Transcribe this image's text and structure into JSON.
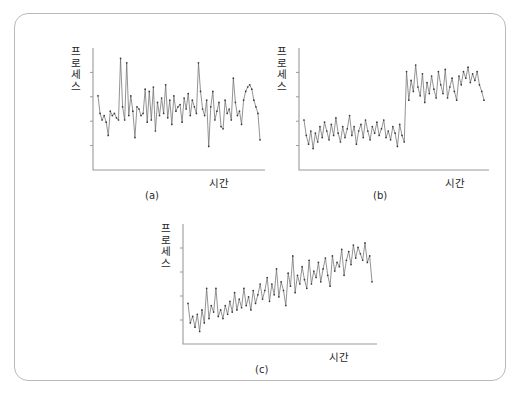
{
  "figure": {
    "background": "#ffffff",
    "border_color": "#b9b9b9",
    "axis_color": "#9a9a9a",
    "line_color": "#6f6f6f",
    "marker_color": "#3a3a3a"
  },
  "panels": [
    {
      "id": "a",
      "caption": "(a)",
      "ylabel": "프로세스",
      "xlabel": "시간"
    },
    {
      "id": "b",
      "caption": "(b)",
      "ylabel": "프로세스",
      "xlabel": "시간"
    },
    {
      "id": "c",
      "caption": "(c)",
      "ylabel": "프로세스",
      "xlabel": "시간"
    }
  ],
  "chart_data": [
    {
      "type": "line",
      "id": "a",
      "title": "(a)",
      "subtitle": "",
      "xlabel": "시간",
      "ylabel": "프로세스",
      "grid": false,
      "legend": "none",
      "xlim": [
        0,
        79
      ],
      "ylim": [
        0,
        100
      ],
      "x": [
        0,
        1,
        2,
        3,
        4,
        5,
        6,
        7,
        8,
        9,
        10,
        11,
        12,
        13,
        14,
        15,
        16,
        17,
        18,
        19,
        20,
        21,
        22,
        23,
        24,
        25,
        26,
        27,
        28,
        29,
        30,
        31,
        32,
        33,
        34,
        35,
        36,
        37,
        38,
        39,
        40,
        41,
        42,
        43,
        44,
        45,
        46,
        47,
        48,
        49,
        50,
        51,
        52,
        53,
        54,
        55,
        56,
        57,
        58,
        59,
        60,
        61,
        62,
        63,
        64,
        65,
        66,
        67,
        68,
        69,
        70,
        71,
        72,
        73,
        74,
        75,
        76,
        77,
        78,
        79
      ],
      "values": [
        62,
        46,
        40,
        44,
        38,
        26,
        48,
        44,
        46,
        42,
        40,
        96,
        52,
        40,
        92,
        44,
        62,
        48,
        24,
        52,
        50,
        44,
        46,
        68,
        38,
        66,
        40,
        70,
        30,
        56,
        44,
        60,
        46,
        72,
        42,
        58,
        36,
        62,
        48,
        52,
        54,
        38,
        60,
        50,
        64,
        44,
        58,
        52,
        46,
        92,
        66,
        50,
        44,
        58,
        16,
        52,
        66,
        40,
        48,
        56,
        34,
        32,
        58,
        46,
        50,
        40,
        78,
        56,
        44,
        48,
        36,
        58,
        66,
        70,
        72,
        68,
        58,
        52,
        46,
        22
      ]
    },
    {
      "type": "line",
      "id": "b",
      "title": "(b)",
      "subtitle": "",
      "xlabel": "시간",
      "ylabel": "프로세스",
      "grid": false,
      "legend": "none",
      "xlim": [
        0,
        79
      ],
      "ylim": [
        0,
        100
      ],
      "x": [
        0,
        1,
        2,
        3,
        4,
        5,
        6,
        7,
        8,
        9,
        10,
        11,
        12,
        13,
        14,
        15,
        16,
        17,
        18,
        19,
        20,
        21,
        22,
        23,
        24,
        25,
        26,
        27,
        28,
        29,
        30,
        31,
        32,
        33,
        34,
        35,
        36,
        37,
        38,
        39,
        40,
        41,
        42,
        43,
        44,
        45,
        46,
        47,
        48,
        49,
        50,
        51,
        52,
        53,
        54,
        55,
        56,
        57,
        58,
        59,
        60,
        61,
        62,
        63,
        64,
        65,
        66,
        67,
        68,
        69,
        70,
        71,
        72,
        73,
        74,
        75,
        76,
        77,
        78,
        79
      ],
      "values": [
        40,
        26,
        18,
        30,
        14,
        28,
        20,
        34,
        24,
        38,
        30,
        22,
        36,
        26,
        42,
        28,
        20,
        34,
        24,
        32,
        44,
        26,
        34,
        18,
        30,
        36,
        24,
        40,
        30,
        22,
        34,
        28,
        38,
        26,
        32,
        40,
        24,
        30,
        22,
        34,
        28,
        16,
        36,
        26,
        20,
        84,
        58,
        76,
        66,
        90,
        70,
        62,
        82,
        56,
        74,
        64,
        80,
        68,
        60,
        84,
        72,
        64,
        86,
        60,
        70,
        78,
        66,
        58,
        80,
        72,
        84,
        78,
        88,
        74,
        82,
        76,
        84,
        72,
        66,
        58
      ]
    },
    {
      "type": "line",
      "id": "c",
      "title": "(c)",
      "subtitle": "",
      "xlabel": "시간",
      "ylabel": "프로세스",
      "grid": false,
      "legend": "none",
      "xlim": [
        0,
        79
      ],
      "ylim": [
        0,
        100
      ],
      "x": [
        0,
        1,
        2,
        3,
        4,
        5,
        6,
        7,
        8,
        9,
        10,
        11,
        12,
        13,
        14,
        15,
        16,
        17,
        18,
        19,
        20,
        21,
        22,
        23,
        24,
        25,
        26,
        27,
        28,
        29,
        30,
        31,
        32,
        33,
        34,
        35,
        36,
        37,
        38,
        39,
        40,
        41,
        42,
        43,
        44,
        45,
        46,
        47,
        48,
        49,
        50,
        51,
        52,
        53,
        54,
        55,
        56,
        57,
        58,
        59,
        60,
        61,
        62,
        63,
        64,
        65,
        66,
        67,
        68,
        69,
        70,
        71,
        72,
        73,
        74,
        75,
        76,
        77,
        78,
        79
      ],
      "values": [
        32,
        14,
        20,
        10,
        22,
        6,
        26,
        14,
        46,
        18,
        30,
        24,
        46,
        20,
        26,
        18,
        30,
        22,
        34,
        24,
        42,
        26,
        36,
        28,
        46,
        30,
        38,
        26,
        44,
        32,
        40,
        50,
        36,
        44,
        56,
        34,
        50,
        40,
        64,
        38,
        52,
        44,
        30,
        60,
        48,
        76,
        42,
        58,
        50,
        66,
        54,
        46,
        72,
        50,
        62,
        56,
        70,
        52,
        64,
        74,
        58,
        48,
        76,
        62,
        70,
        66,
        82,
        58,
        72,
        80,
        68,
        86,
        74,
        84,
        78,
        72,
        88,
        70,
        76,
        52
      ]
    }
  ]
}
